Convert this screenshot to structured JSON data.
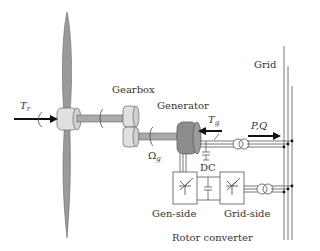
{
  "labels": {
    "gearbox": "Gearbox",
    "generator": "Generator",
    "grid": "Grid",
    "rotor_torque": "T",
    "rotor_torque_sub": "r",
    "gen_torque": "T",
    "gen_torque_sub": "g",
    "gen_speed": "Ω",
    "gen_speed_sub": "g",
    "power": "P,Q",
    "dc": "DC",
    "gen_side": "Gen-side",
    "grid_side": "Grid-side",
    "rotor_converter": "Rotor converter"
  },
  "colors": {
    "blade": "#9a9a9a",
    "hub": "#e0e0e0",
    "generator": "#8c8c8c",
    "line": "#555555",
    "arrow": "#111111"
  }
}
